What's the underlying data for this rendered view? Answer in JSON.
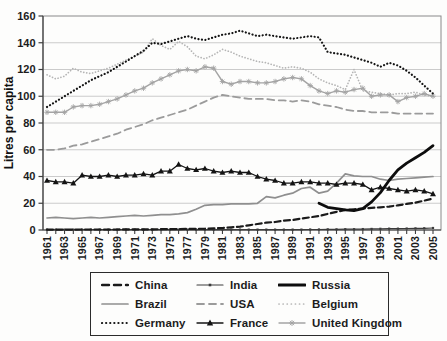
{
  "chart_data": {
    "type": "line",
    "title": "",
    "xlabel": "",
    "ylabel": "Litres per capita",
    "ylim": [
      0,
      160
    ],
    "ytick_step": 20,
    "ytick_labels": [
      "0",
      "20",
      "40",
      "60",
      "80",
      "100",
      "120",
      "140",
      "160"
    ],
    "x_range": [
      1961,
      2005
    ],
    "x_tick_labels": [
      "1961",
      "1963",
      "1965",
      "1967",
      "1969",
      "1971",
      "1973",
      "1975",
      "1977",
      "1979",
      "1981",
      "1983",
      "1985",
      "1987",
      "1989",
      "1991",
      "1993",
      "1995",
      "1997",
      "1999",
      "2001",
      "2003",
      "2005"
    ],
    "grid": true,
    "legend_position": "bottom",
    "legend_layout": [
      "China",
      "India",
      "Russia",
      "Brazil",
      "USA",
      "Belgium",
      "Germany",
      "France",
      "United Kingdom"
    ],
    "series": [
      {
        "name": "Belgium",
        "color": "#b5b5b5",
        "style": "dotted",
        "width": 1.7,
        "marker": "none",
        "values": [
          116,
          113,
          115,
          121,
          118,
          117,
          119,
          121,
          124,
          127,
          130,
          133,
          143,
          138,
          135,
          141,
          137,
          130,
          128,
          131,
          135,
          133,
          130,
          128,
          126,
          125,
          123,
          121,
          122,
          121,
          118,
          113,
          110,
          108,
          105,
          120,
          104,
          103,
          102,
          101,
          102,
          102,
          103,
          101,
          100
        ]
      },
      {
        "name": "United Kingdom",
        "color": "#a4a4a4",
        "style": "solid",
        "width": 1.4,
        "marker": "star",
        "values": [
          88,
          88,
          88,
          92,
          93,
          93,
          94,
          96,
          98,
          101,
          104,
          106,
          110,
          113,
          116,
          119,
          120,
          119,
          122,
          121,
          111,
          109,
          111,
          111,
          110,
          110,
          111,
          113,
          114,
          113,
          108,
          104,
          102,
          104,
          103,
          105,
          106,
          100,
          101,
          101,
          96,
          99,
          100,
          102,
          100
        ]
      },
      {
        "name": "USA",
        "color": "#9b9b9b",
        "style": "dashed",
        "width": 1.8,
        "marker": "none",
        "values": [
          60,
          60,
          61,
          63,
          64,
          66,
          68,
          70,
          72,
          75,
          77,
          79,
          82,
          84,
          86,
          88,
          90,
          93,
          96,
          99,
          101,
          100,
          99,
          98,
          98,
          98,
          97,
          97,
          96,
          97,
          96,
          94,
          93,
          92,
          90,
          89,
          89,
          88,
          88,
          88,
          87,
          87,
          87,
          87,
          87
        ]
      },
      {
        "name": "Brazil",
        "color": "#8f8f8f",
        "style": "solid",
        "width": 1.7,
        "marker": "none",
        "values": [
          9,
          9.5,
          9,
          8.5,
          9,
          9.5,
          9,
          9.5,
          10,
          10.5,
          11,
          10.5,
          11,
          11.5,
          11.5,
          12,
          13,
          15.5,
          18.5,
          19,
          19,
          19.5,
          19.5,
          19.5,
          20,
          25,
          24,
          26,
          27.5,
          31,
          32,
          27.5,
          29,
          35,
          42,
          40.5,
          40,
          40,
          38,
          37,
          38,
          38.5,
          39,
          39.5,
          40
        ]
      },
      {
        "name": "Germany",
        "color": "#141414",
        "style": "dotted",
        "width": 2.2,
        "marker": "none",
        "values": [
          92,
          96,
          100,
          104,
          108,
          112,
          115,
          118,
          122,
          126,
          130,
          134,
          140,
          139,
          141,
          143,
          145,
          143,
          142,
          144,
          146,
          147,
          149,
          147,
          145,
          146,
          145,
          144,
          143,
          144,
          145,
          144,
          133,
          132,
          131,
          129,
          127,
          125,
          122,
          125,
          123,
          119,
          114,
          108,
          102
        ]
      },
      {
        "name": "India",
        "color": "#3c3c3c",
        "style": "solid",
        "width": 1.2,
        "marker": "square",
        "values": [
          0.3,
          0.3,
          0.3,
          0.3,
          0.3,
          0.3,
          0.3,
          0.3,
          0.3,
          0.3,
          0.3,
          0.3,
          0.3,
          0.3,
          0.3,
          0.3,
          0.3,
          0.3,
          0.3,
          0.3,
          0.3,
          0.3,
          0.3,
          0.3,
          0.3,
          0.3,
          0.3,
          0.3,
          0.3,
          0.3,
          0.4,
          0.4,
          0.5,
          0.5,
          0.6,
          0.6,
          0.7,
          0.8,
          0.9,
          1,
          1,
          1.1,
          1.2,
          1.3,
          1.5
        ]
      },
      {
        "name": "France",
        "color": "#141414",
        "style": "solid",
        "width": 1.3,
        "marker": "triangle",
        "values": [
          37,
          36,
          36,
          35,
          41,
          40,
          40,
          41,
          40,
          41,
          41,
          42,
          41,
          44,
          44,
          49,
          46,
          45,
          46,
          44,
          43,
          44,
          43,
          43,
          40,
          38,
          37,
          35,
          35,
          36,
          36,
          35,
          35,
          34,
          35,
          35,
          34,
          30,
          32,
          31,
          30,
          29,
          30,
          29,
          27
        ]
      },
      {
        "name": "China",
        "color": "#1a1a1a",
        "style": "dashed",
        "width": 2.2,
        "marker": "none",
        "values": [
          0.3,
          0.3,
          0.3,
          0.3,
          0.4,
          0.4,
          0.4,
          0.4,
          0.4,
          0.5,
          0.5,
          0.5,
          0.5,
          0.6,
          0.6,
          0.7,
          0.8,
          0.9,
          1,
          1.2,
          1.5,
          2,
          2.5,
          3.5,
          4.5,
          5.5,
          6,
          7,
          7.5,
          8.5,
          9.5,
          10.5,
          12,
          13.5,
          15,
          15.5,
          16,
          16.5,
          17,
          17.5,
          18.5,
          19.5,
          20.5,
          22,
          23.5
        ]
      },
      {
        "name": "Russia",
        "color": "#0d0d0d",
        "style": "solid",
        "width": 2.8,
        "marker": "none",
        "values": [
          null,
          null,
          null,
          null,
          null,
          null,
          null,
          null,
          null,
          null,
          null,
          null,
          null,
          null,
          null,
          null,
          null,
          null,
          null,
          null,
          null,
          null,
          null,
          null,
          null,
          null,
          null,
          null,
          null,
          null,
          null,
          20,
          17,
          16,
          15,
          14.5,
          16,
          21,
          28,
          37,
          45,
          50,
          54,
          58,
          63
        ]
      }
    ]
  }
}
